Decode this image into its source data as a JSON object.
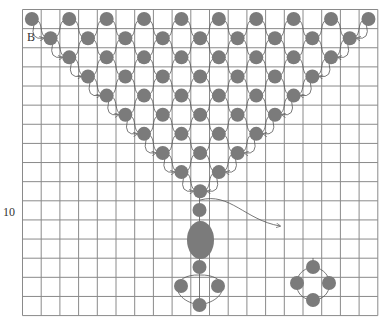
{
  "labels": {
    "start_marker": "B",
    "row_marker": "10"
  },
  "colors": {
    "bead": "#7b7b7b",
    "grid": "#8a8a8a",
    "thread": "#555555",
    "background": "#ffffff"
  },
  "grid": {
    "x0": 22.5,
    "y0": 9.5,
    "cols": 19,
    "rows": 16,
    "cell_w": 18.7,
    "cell_h": 19.13
  },
  "beads": {
    "triangle_rows": [
      {
        "row": 0,
        "cols": [
          0,
          2,
          4,
          6,
          8,
          10,
          12,
          14,
          16,
          18
        ]
      },
      {
        "row": 1,
        "cols": [
          1,
          3,
          5,
          7,
          9,
          11,
          13,
          15,
          17
        ]
      },
      {
        "row": 2,
        "cols": [
          2,
          4,
          6,
          8,
          10,
          12,
          14,
          16
        ]
      },
      {
        "row": 3,
        "cols": [
          3,
          5,
          7,
          9,
          11,
          13,
          15
        ]
      },
      {
        "row": 4,
        "cols": [
          4,
          6,
          8,
          10,
          12,
          14
        ]
      },
      {
        "row": 5,
        "cols": [
          5,
          7,
          9,
          11,
          13
        ]
      },
      {
        "row": 6,
        "cols": [
          6,
          8,
          10,
          12
        ]
      },
      {
        "row": 7,
        "cols": [
          7,
          9,
          11
        ]
      },
      {
        "row": 8,
        "cols": [
          8,
          10
        ]
      },
      {
        "row": 9,
        "cols": [
          9
        ]
      }
    ],
    "stem": [
      {
        "x": 199.5,
        "y": 210
      },
      {
        "x": 199.5,
        "y": 267
      },
      {
        "x": 181,
        "y": 286
      },
      {
        "x": 218,
        "y": 286
      },
      {
        "x": 199.5,
        "y": 305
      }
    ],
    "oval": {
      "cx": 200.5,
      "cy": 240,
      "rx": 13.5,
      "ry": 19
    },
    "side_cluster": [
      {
        "x": 313,
        "y": 267
      },
      {
        "x": 297,
        "y": 283
      },
      {
        "x": 329,
        "y": 283
      },
      {
        "x": 313,
        "y": 300
      }
    ],
    "radius": 7
  },
  "arrows": {
    "exit_thread": {
      "from": [
        200,
        200
      ],
      "to": [
        280,
        226
      ]
    }
  }
}
